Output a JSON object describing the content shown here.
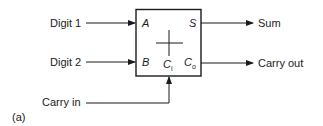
{
  "diagram": {
    "figure_label": "(a)",
    "inputs": [
      {
        "label": "Digit 1",
        "port": "A"
      },
      {
        "label": "Digit 2",
        "port": "B"
      },
      {
        "label": "Carry in",
        "port": "C",
        "port_sub": "i"
      }
    ],
    "outputs": [
      {
        "label": "Sum",
        "port": "S"
      },
      {
        "label": "Carry out",
        "port": "C",
        "port_sub": "o"
      }
    ],
    "block": {
      "symbol": "+",
      "type": "full-adder"
    },
    "colors": {
      "line": "#1a1a1a",
      "background": "#ffffff"
    }
  }
}
